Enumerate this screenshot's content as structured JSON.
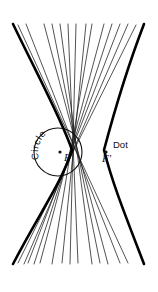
{
  "figure": {
    "type": "geometric-construction",
    "background_color": "#ffffff",
    "ink_color": "#000000",
    "canvas": {
      "width": 158,
      "height": 292
    },
    "labels": {
      "circle": {
        "text": "Circle",
        "style": "curved along upper-left arc of the circle",
        "color": "#111111",
        "font_size": 9
      },
      "dot": {
        "text": "Dot",
        "color": "#111111",
        "font_size": 9,
        "x": 113,
        "y": 148
      },
      "focus_near": {
        "text": "F",
        "color": "#111111",
        "font_size": 10,
        "x": 64,
        "y": 161,
        "point": {
          "x": 60,
          "y": 152
        }
      },
      "focus_far": {
        "text": "F'",
        "color": "#111111",
        "font_size": 10,
        "x": 104,
        "y": 162,
        "point": {
          "x": 106,
          "y": 152
        }
      }
    },
    "circle_geometry": {
      "center_x": 58,
      "center_y": 152,
      "radius": 24,
      "stroke_width": 1
    },
    "hyperbola": {
      "center_x": 88,
      "center_y": 150,
      "vertex_left_x": 72,
      "vertex_right_x": 104,
      "semi_transverse_a": 16,
      "semi_conjugate_b": 26,
      "stroke_width": 2.6,
      "color": "#000000"
    },
    "envelope_lines": {
      "count": 14,
      "stroke_width": 0.75,
      "color": "#1a1a1a",
      "top_y": 24,
      "bottom_y": 264,
      "note": "chords of the directrix circle extended; they are tangent to the hyperbola"
    }
  }
}
